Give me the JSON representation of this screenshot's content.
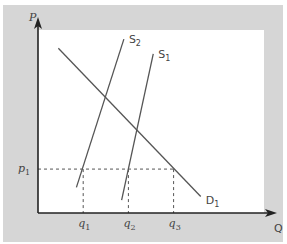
{
  "chart_data": {
    "type": "line",
    "title": "",
    "xlabel": "Q",
    "ylabel": "P",
    "xlim": [
      0,
      100
    ],
    "ylim": [
      0,
      100
    ],
    "grid": false,
    "series": [
      {
        "name": "D1",
        "label_main": "D",
        "label_sub": "1",
        "kind": "demand",
        "points": [
          [
            9,
            90
          ],
          [
            72,
            9
          ]
        ]
      },
      {
        "name": "S2",
        "label_main": "S",
        "label_sub": "2",
        "kind": "supply",
        "points": [
          [
            17,
            14
          ],
          [
            38,
            95
          ]
        ]
      },
      {
        "name": "S1",
        "label_main": "S",
        "label_sub": "1",
        "kind": "supply",
        "points": [
          [
            37,
            7
          ],
          [
            51,
            87
          ]
        ]
      }
    ],
    "reference_lines": {
      "price": {
        "label_main": "p",
        "label_sub": "1",
        "value": 24,
        "x_end": 60
      },
      "quantities": [
        {
          "label_main": "q",
          "label_sub": "1",
          "value": 20
        },
        {
          "label_main": "q",
          "label_sub": "2",
          "value": 40
        },
        {
          "label_main": "q",
          "label_sub": "3",
          "value": 60
        }
      ]
    }
  },
  "colors": {
    "frame": "#d6d6d6",
    "plot_bg": "#ffffff",
    "axis": "#222222",
    "curve": "#555555",
    "dash": "#555555",
    "text": "#444444"
  }
}
